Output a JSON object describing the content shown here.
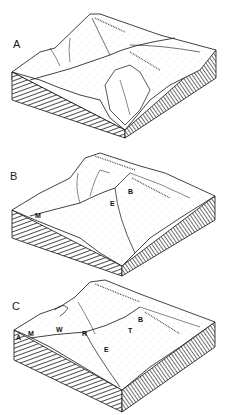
{
  "figure": {
    "panels": [
      {
        "letter": "A",
        "labels": []
      },
      {
        "letter": "B",
        "labels": [
          "M",
          "E",
          "B"
        ]
      },
      {
        "letter": "C",
        "labels": [
          "A",
          "M",
          "W",
          "R",
          "E",
          "T",
          "B"
        ]
      }
    ]
  },
  "colors": {
    "ink": "#1a1a1a",
    "paper": "#ffffff"
  }
}
